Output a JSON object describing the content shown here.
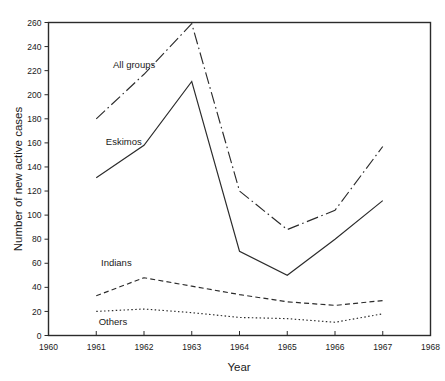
{
  "chart_data": {
    "type": "line",
    "title": "",
    "xlabel": "Year",
    "ylabel": "Number of new active cases",
    "x": [
      1961,
      1962,
      1963,
      1964,
      1965,
      1966,
      1967
    ],
    "xlim": [
      1960,
      1968
    ],
    "ylim": [
      0,
      260
    ],
    "xticks": [
      "1960",
      "1961",
      "1962",
      "1963",
      "1964",
      "1965",
      "1966",
      "1967",
      "1968"
    ],
    "yticks": [
      "0",
      "20",
      "40",
      "60",
      "80",
      "100",
      "120",
      "140",
      "160",
      "180",
      "200",
      "220",
      "240",
      "260"
    ],
    "grid": false,
    "legend_position": "inline-labels",
    "series": [
      {
        "name": "All groups",
        "style": "dash-dot",
        "color": "#2b2b2b",
        "values": [
          180,
          217,
          259,
          120,
          88,
          104,
          157
        ]
      },
      {
        "name": "Eskimos",
        "style": "solid",
        "color": "#2b2b2b",
        "values": [
          131,
          158,
          211,
          70,
          50,
          80,
          112
        ]
      },
      {
        "name": "Indians",
        "style": "dashed",
        "color": "#2b2b2b",
        "values": [
          33,
          48,
          41,
          34,
          28,
          25,
          29
        ]
      },
      {
        "name": "Others",
        "style": "dotted",
        "color": "#2b2b2b",
        "values": [
          20,
          22,
          19,
          15,
          14,
          11,
          18
        ]
      }
    ],
    "annotations": [
      {
        "text": "All groups",
        "x": 1961.35,
        "y": 222
      },
      {
        "text": "Eskimos",
        "x": 1961.2,
        "y": 158
      },
      {
        "text": "Indians",
        "x": 1961.1,
        "y": 58
      },
      {
        "text": "Others",
        "x": 1961.05,
        "y": 9
      }
    ]
  }
}
